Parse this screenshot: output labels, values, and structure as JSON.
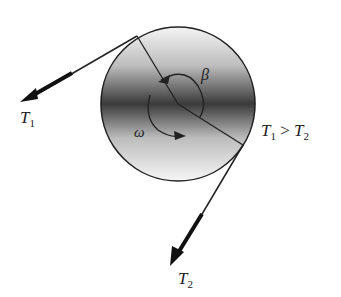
{
  "figure": {
    "labels": {
      "t1": {
        "main": "T",
        "sub": "1"
      },
      "t2": {
        "main": "T",
        "sub": "2"
      },
      "relation": {
        "left": "T",
        "left_sub": "1",
        "op": " > ",
        "right": "T",
        "right_sub": "2"
      },
      "beta": "β",
      "omega": "ω"
    },
    "colors": {
      "ink": "#222222",
      "shade_dark": "#3a3a3a",
      "shade_light": "#f2f2f2",
      "background": "#ffffff"
    }
  }
}
